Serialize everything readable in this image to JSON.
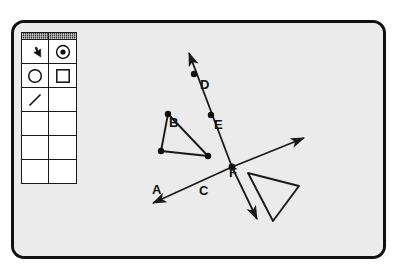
{
  "app": {
    "window_title": "",
    "canvas_bg": "#ebebeb",
    "border_color": "#111111",
    "ink_color": "#1a1a1a"
  },
  "tool_palette": {
    "name": "tools",
    "columns": 2,
    "titlebar_cells": [
      "",
      ""
    ],
    "rows": [
      {
        "cells": [
          {
            "icon": "arrow-pointer-icon",
            "label": "Select",
            "selected": false
          },
          {
            "icon": "point-icon",
            "label": "Point",
            "selected": false
          }
        ]
      },
      {
        "cells": [
          {
            "icon": "circle-icon",
            "label": "Circle",
            "selected": false
          },
          {
            "icon": "square-icon",
            "label": "Rectangle",
            "selected": false
          }
        ]
      },
      {
        "cells": [
          {
            "icon": "line-segment-icon",
            "label": "Segment",
            "selected": false
          },
          {
            "icon": "empty-icon",
            "label": "",
            "selected": false
          }
        ]
      },
      {
        "cells": [
          {
            "icon": "empty-icon",
            "label": "",
            "selected": false
          },
          {
            "icon": "empty-icon",
            "label": "",
            "selected": false
          }
        ]
      },
      {
        "cells": [
          {
            "icon": "empty-icon",
            "label": "",
            "selected": false
          },
          {
            "icon": "empty-icon",
            "label": "",
            "selected": false
          }
        ]
      },
      {
        "cells": [
          {
            "icon": "empty-icon",
            "label": "",
            "selected": false
          },
          {
            "icon": "empty-icon",
            "label": "",
            "selected": false
          }
        ]
      }
    ]
  },
  "drawing": {
    "points": [
      {
        "id": "A",
        "label": "A",
        "x": 161,
        "y": 151,
        "label_x": 152,
        "label_y": 160
      },
      {
        "id": "B",
        "label": "B",
        "x": 168,
        "y": 114,
        "label_x": 169,
        "label_y": 93
      },
      {
        "id": "C",
        "label": "C",
        "x": 208,
        "y": 156,
        "label_x": 199,
        "label_y": 161
      },
      {
        "id": "D",
        "label": "D",
        "x": 194,
        "y": 74,
        "label_x": 200,
        "label_y": 55
      },
      {
        "id": "E",
        "label": "E",
        "x": 211,
        "y": 115,
        "label_x": 214,
        "label_y": 95
      },
      {
        "id": "F",
        "label": "F",
        "x": 232,
        "y": 167,
        "label_x": 229,
        "label_y": 143
      }
    ],
    "segments": [
      {
        "name": "segment-AB",
        "from": [
          161,
          151
        ],
        "to": [
          168,
          114
        ]
      },
      {
        "name": "segment-BC",
        "from": [
          168,
          114
        ],
        "to": [
          208,
          156
        ]
      },
      {
        "name": "segment-AC",
        "from": [
          161,
          151
        ],
        "to": [
          208,
          156
        ]
      }
    ],
    "rays": [
      {
        "name": "ray-DEF-upward",
        "from": [
          232,
          167
        ],
        "to": [
          188,
          51
        ],
        "arrow_at_end": true
      },
      {
        "name": "ray-through-F-northeast",
        "from": [
          232,
          167
        ],
        "to": [
          305,
          137
        ],
        "arrow_at_end": true
      },
      {
        "name": "ray-through-F-southwest",
        "from": [
          232,
          167
        ],
        "to": [
          151,
          203
        ],
        "arrow_at_end": true
      },
      {
        "name": "ray-through-F-southeast",
        "from": [
          232,
          167
        ],
        "to": [
          258,
          219
        ],
        "arrow_at_end": true
      }
    ],
    "shapes": [
      {
        "name": "unlabeled-triangle",
        "type": "polygon",
        "vertices": [
          [
            248,
            173
          ],
          [
            299,
            186
          ],
          [
            273,
            221
          ]
        ],
        "filled": false
      }
    ]
  }
}
